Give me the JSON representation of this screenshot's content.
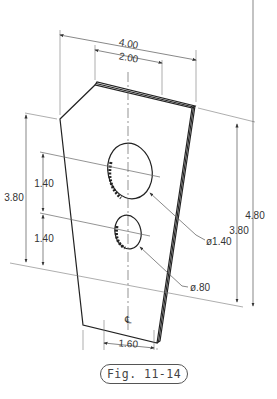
{
  "figure": {
    "caption": "Fig. 11-14",
    "type": "isometric plate with two holes"
  },
  "dimensions": {
    "overall_width": "4.00",
    "top_width": "2.00",
    "bottom_width": "1.60",
    "left_height": "3.80",
    "hole_spacing_upper": "1.40",
    "hole_spacing_lower": "1.40",
    "right_height_inner": "3.80",
    "right_height_outer": "4.80",
    "large_hole_diameter": "ø1.40",
    "small_hole_diameter": "ø.80",
    "centerline_symbol": "℄"
  },
  "colors": {
    "line": "#222222",
    "dim_line": "#555555",
    "text": "#333333"
  }
}
